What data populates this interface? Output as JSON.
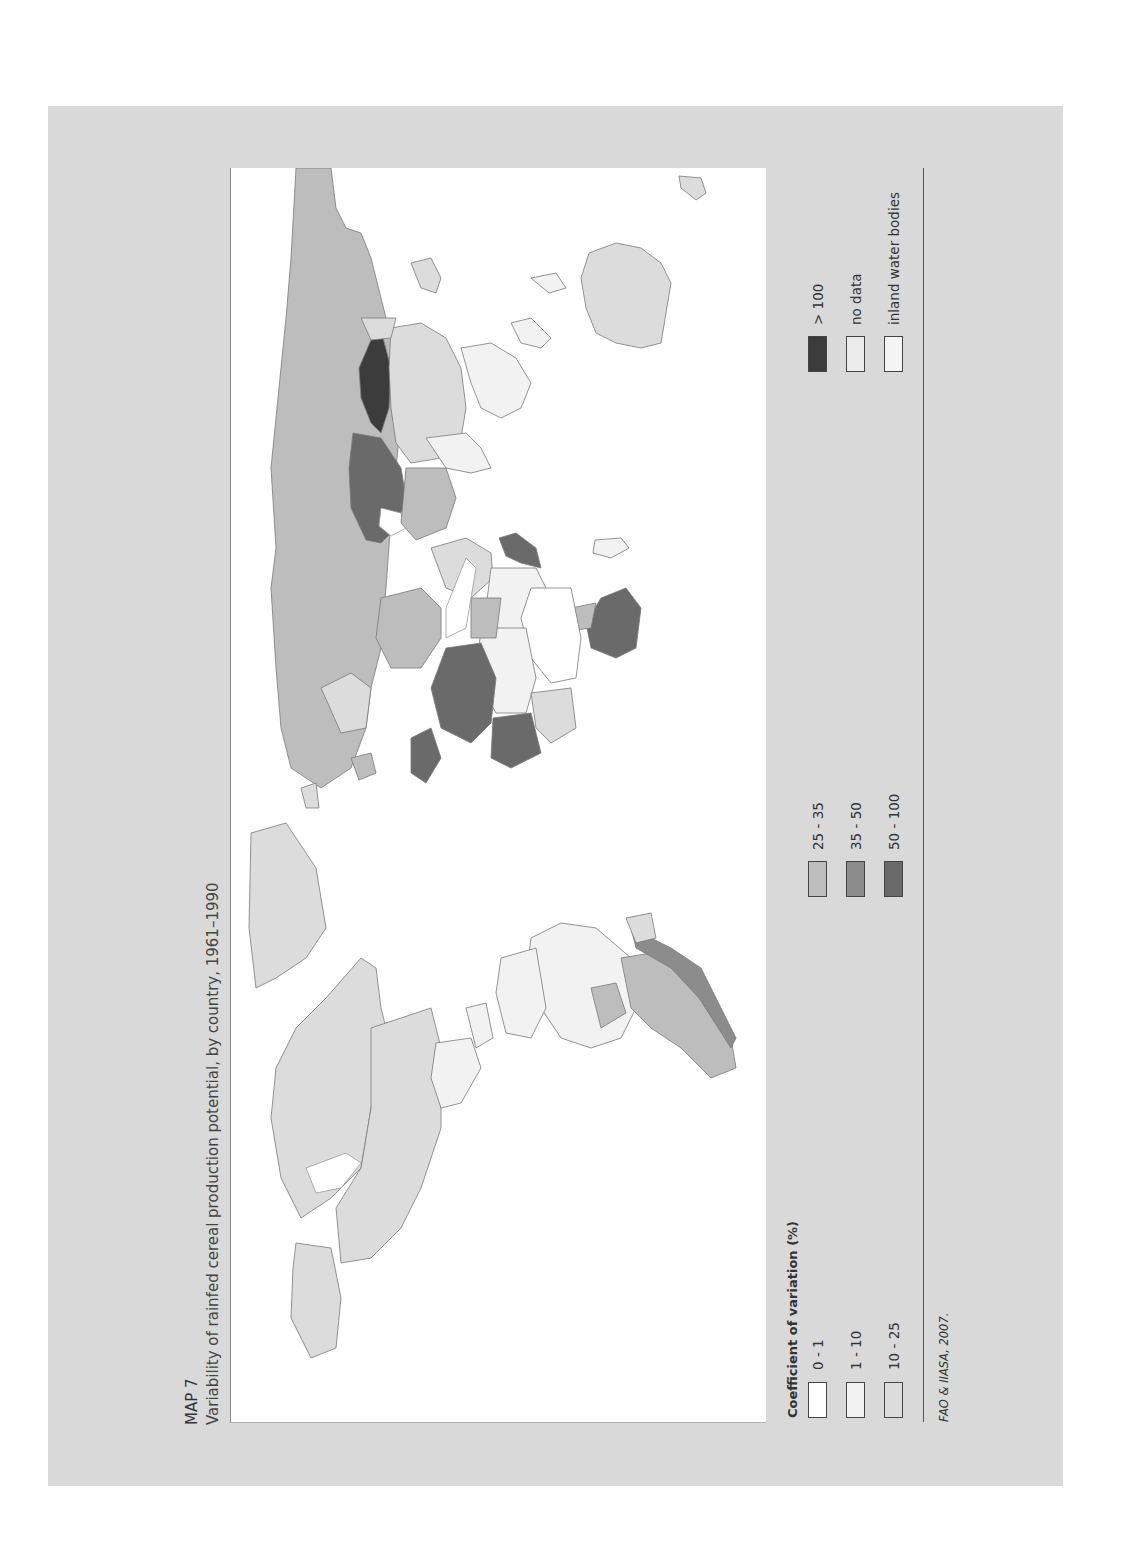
{
  "header": {
    "map_number": "MAP 7",
    "title": "Variability of rainfed cereal production potential, by country, 1961–1990"
  },
  "legend": {
    "title": "Coefficient of variation (%)",
    "items": [
      {
        "label": "0 - 1",
        "color": "#ffffff"
      },
      {
        "label": "1 - 10",
        "color": "#f2f2f2"
      },
      {
        "label": "10 - 25",
        "color": "#dcdcdc"
      },
      {
        "label": "25 - 35",
        "color": "#bdbdbd"
      },
      {
        "label": "35 - 50",
        "color": "#8c8c8c"
      },
      {
        "label": "50 - 100",
        "color": "#6a6a6a"
      },
      {
        "label": "> 100",
        "color": "#3c3c3c"
      },
      {
        "label": "no data",
        "color": "#ececec"
      },
      {
        "label": "inland water bodies",
        "color": "#f4f4f4"
      }
    ]
  },
  "source": "FAO & IIASA, 2007.",
  "colors": {
    "panel_background": "#d9d9d9",
    "map_background": "#ffffff",
    "country_border": "#7a7a7a"
  },
  "map": {
    "orientation": "rotated 90° counter-clockwise",
    "regions": [
      {
        "name": "Russia / northern Eurasia",
        "class": "25 - 35"
      },
      {
        "name": "Kazakhstan",
        "class": "> 100"
      },
      {
        "name": "Ukraine / Eastern Europe",
        "class": "50 - 100"
      },
      {
        "name": "China",
        "class": "10 - 25"
      },
      {
        "name": "Australia",
        "class": "10 - 25"
      },
      {
        "name": "Northwest Africa",
        "class": "50 - 100"
      },
      {
        "name": "Southern Africa",
        "class": "50 - 100"
      },
      {
        "name": "Iberia / North Africa coast",
        "class": "50 - 100"
      },
      {
        "name": "India",
        "class": "1 - 10"
      },
      {
        "name": "Canada / USA / Mexico",
        "class": "10 - 25"
      },
      {
        "name": "Greenland",
        "class": "10 - 25"
      },
      {
        "name": "Brazil",
        "class": "1 - 10"
      },
      {
        "name": "Argentina",
        "class": "25 - 35"
      }
    ]
  }
}
